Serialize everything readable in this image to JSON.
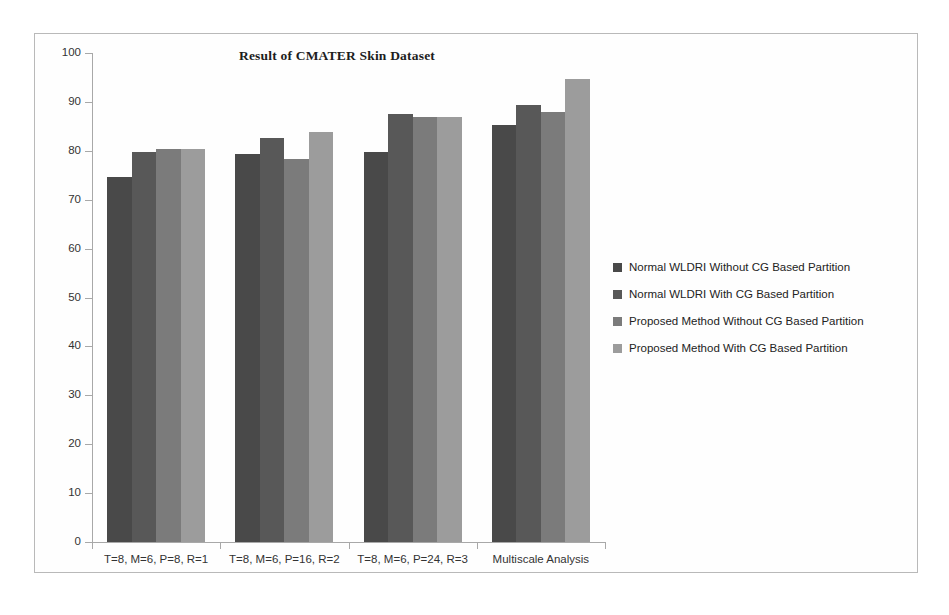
{
  "chart_data": {
    "type": "bar",
    "title": "Result of CMATER Skin Dataset",
    "xlabel": "",
    "ylabel": "",
    "ylim": [
      0,
      100
    ],
    "yticks": [
      0,
      10,
      20,
      30,
      40,
      50,
      60,
      70,
      80,
      90,
      100
    ],
    "ytick_labels": [
      "0",
      "10",
      "20",
      "30",
      "40",
      "50",
      "60",
      "70",
      "80",
      "90",
      "100"
    ],
    "grid": false,
    "legend_position": "right",
    "categories": [
      "T=8, M=6, P=8, R=1",
      "T=8, M=6, P=16, R=2",
      "T=8, M=6, P=24, R=3",
      "Multiscale Analysis"
    ],
    "series": [
      {
        "name": "Normal WLDRI Without CG Based Partition",
        "color": "#494949",
        "values": [
          74.7,
          79.4,
          79.8,
          85.2
        ]
      },
      {
        "name": "Normal WLDRI With CG Based Partition",
        "color": "#585858",
        "values": [
          79.8,
          82.7,
          87.6,
          89.3
        ]
      },
      {
        "name": "Proposed Method Without CG Based Partition",
        "color": "#7b7b7b",
        "values": [
          80.3,
          78.3,
          87.0,
          88.0
        ]
      },
      {
        "name": "Proposed Method With CG Based Partition",
        "color": "#9c9c9c",
        "values": [
          80.3,
          83.9,
          87.0,
          94.7
        ]
      }
    ]
  }
}
